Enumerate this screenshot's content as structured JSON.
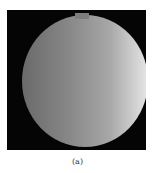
{
  "figure": {
    "caption": "(a)",
    "colors": {
      "background": "#050505",
      "dark_side": "#6a6a6a",
      "bright_side": "#e6e6e6"
    }
  }
}
